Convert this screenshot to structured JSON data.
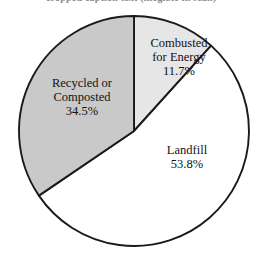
{
  "figure": {
    "title_fragment": "cropped caption text (illegible in scan)",
    "background_color": "#ffffff"
  },
  "chart_data": {
    "type": "pie",
    "title": "",
    "xlabel": "",
    "ylabel": "",
    "legend_position": "none",
    "grid": false,
    "start_angle_deg": 0,
    "direction": "clockwise",
    "center": {
      "x": 134,
      "y": 131
    },
    "radius": 115,
    "outline_color": "#1a1a1a",
    "categories": [
      "Combusted for Energy",
      "Landfill",
      "Recycled or Composted"
    ],
    "values": [
      11.7,
      53.8,
      34.5
    ],
    "unit": "%",
    "slices": [
      {
        "name": "Combusted for Energy",
        "label_line1": "Combusted",
        "label_line2": "for Energy",
        "value": 11.7,
        "value_label": "11.7%",
        "angle_deg": 42.1,
        "start_deg": 0,
        "end_deg": 42.1,
        "fill": "#e6e6e6"
      },
      {
        "name": "Landfill",
        "label_line1": "Landfill",
        "label_line2": "",
        "value": 53.8,
        "value_label": "53.8%",
        "angle_deg": 193.7,
        "start_deg": 42.1,
        "end_deg": 235.8,
        "fill": "#ffffff"
      },
      {
        "name": "Recycled or Composted",
        "label_line1": "Recycled or",
        "label_line2": "Composted",
        "value": 34.5,
        "value_label": "34.5%",
        "angle_deg": 124.2,
        "start_deg": 235.8,
        "end_deg": 360,
        "fill": "#c9c9c9"
      }
    ]
  }
}
